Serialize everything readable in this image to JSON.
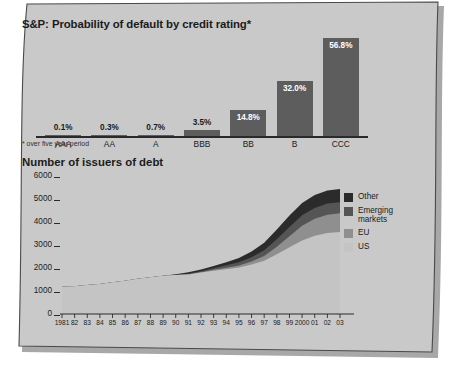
{
  "page": {
    "sheet_color": "#c9c9c9",
    "shadow_color": "#a8a8a8",
    "border_color": "#4a4a4a"
  },
  "bar_chart": {
    "title": "S&P: Probability of default by credit rating*",
    "footnote": "* over five year period",
    "bar_color": "#5d5d5d",
    "axis_color": "#2a2a2a"
  },
  "area_chart": {
    "title": "Number of issuers of debt"
  },
  "legend": {
    "items": [
      {
        "label": "Other",
        "label2": "",
        "color": "#2b2b2b"
      },
      {
        "label": "Emerging",
        "label2": "markets",
        "color": "#555555"
      },
      {
        "label": "EU",
        "label2": "",
        "color": "#8f8f8f"
      },
      {
        "label": "US",
        "label2": "",
        "color": "#c4c4c4"
      }
    ]
  },
  "chart_data": [
    {
      "type": "bar",
      "title": "S&P: Probability of default by credit rating*",
      "subtitle": "* over five year period",
      "xlabel": "",
      "ylabel": "",
      "categories": [
        "AAA",
        "AA",
        "A",
        "BBB",
        "BB",
        "B",
        "CCC"
      ],
      "values": [
        0.1,
        0.3,
        0.7,
        3.5,
        14.8,
        32.0,
        56.8
      ],
      "value_labels": [
        "0.1%",
        "0.3%",
        "0.7%",
        "3.5%",
        "14.8%",
        "32.0%",
        "56.8%"
      ],
      "label_placement": [
        "outside",
        "outside",
        "outside",
        "outside",
        "inside",
        "inside",
        "inside"
      ],
      "ylim": [
        0,
        60
      ],
      "grid": false,
      "legend": "none",
      "series_color": "#5d5d5d"
    },
    {
      "type": "area",
      "title": "Number of issuers of debt",
      "xlabel": "",
      "ylabel": "",
      "stacked": true,
      "grid": false,
      "legend_position": "right",
      "ylim": [
        0,
        6000
      ],
      "yticks": [
        0,
        1000,
        2000,
        3000,
        4000,
        5000,
        6000
      ],
      "ytick_labels": [
        "0",
        "1000",
        "2000",
        "3000",
        "4000",
        "5000",
        "6000"
      ],
      "x": [
        1981,
        1982,
        1983,
        1984,
        1985,
        1986,
        1987,
        1988,
        1989,
        1990,
        1991,
        1992,
        1993,
        1994,
        1995,
        1996,
        1997,
        1998,
        1999,
        2000,
        2001,
        2002,
        2003
      ],
      "xtick_labels": [
        "1981",
        "82",
        "83",
        "84",
        "85",
        "86",
        "87",
        "88",
        "89",
        "90",
        "91",
        "92",
        "93",
        "94",
        "95",
        "96",
        "97",
        "98",
        "99",
        "2000",
        "01",
        "02",
        "03"
      ],
      "series": [
        {
          "name": "US",
          "color": "#c4c4c4",
          "values": [
            1180,
            1210,
            1260,
            1300,
            1380,
            1450,
            1530,
            1600,
            1660,
            1700,
            1720,
            1800,
            1880,
            1950,
            2020,
            2150,
            2320,
            2600,
            2900,
            3200,
            3400,
            3520,
            3560
          ]
        },
        {
          "name": "EU",
          "color": "#8f8f8f",
          "values": [
            0,
            0,
            0,
            0,
            0,
            0,
            0,
            0,
            0,
            0,
            10,
            20,
            40,
            60,
            90,
            130,
            200,
            320,
            480,
            640,
            740,
            800,
            820
          ]
        },
        {
          "name": "Emerging markets",
          "color": "#555555",
          "values": [
            0,
            0,
            0,
            0,
            0,
            0,
            0,
            0,
            0,
            0,
            20,
            40,
            70,
            110,
            140,
            190,
            250,
            330,
            400,
            450,
            470,
            480,
            480
          ]
        },
        {
          "name": "Other",
          "color": "#2b2b2b",
          "values": [
            0,
            0,
            0,
            0,
            0,
            0,
            0,
            0,
            0,
            30,
            60,
            80,
            100,
            130,
            180,
            250,
            330,
            420,
            500,
            540,
            560,
            570,
            575
          ]
        }
      ]
    }
  ]
}
